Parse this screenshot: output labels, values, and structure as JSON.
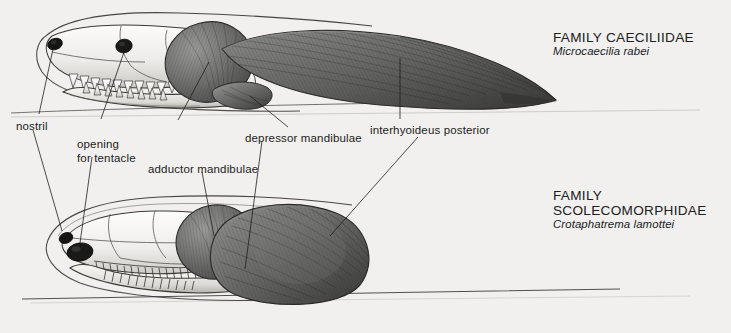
{
  "plate": {
    "background_color": "#f1f0ee",
    "ink_color": "#1c1c1c",
    "bone_color": "#f2f1ee",
    "muscle_color": "#6e6e6e",
    "muscle_dark": "#3b3b3b",
    "title": "Comparative cranial and jaw musculature of caecilians"
  },
  "specimens": [
    {
      "id": "upper",
      "family": "FAMILY CAECILIIDAE",
      "species": "Microcaecilia rabei",
      "family_label_x": 553,
      "family_label_y": 30,
      "description": "Elongate caeciliid skull with long slender interhyoideus posterior tapering posteriorly"
    },
    {
      "id": "lower",
      "family": "FAMILY SCOLECOMORPHIDAE",
      "species": "Crotaphatrema lamottei",
      "family_label_x": 553,
      "family_label_y": 188,
      "description": "Scolecomorphid skull with enlarged tentacle aperture and bulky blunt interhyoideus posterior"
    }
  ],
  "annotations": [
    {
      "key": "nostril",
      "text": "nostril",
      "x": 16,
      "y": 120,
      "align": "left",
      "lines": 1
    },
    {
      "key": "opening-for-tentacle",
      "text": "opening\nfor tentacle",
      "x": 77,
      "y": 140,
      "align": "left",
      "lines": 2
    },
    {
      "key": "adductor-mandibulae",
      "text": "adductor mandibulae",
      "x": 148,
      "y": 164,
      "align": "left",
      "lines": 1
    },
    {
      "key": "depressor-mandibulae",
      "text": "depressor mandibulae",
      "x": 245,
      "y": 133,
      "align": "left",
      "lines": 1
    },
    {
      "key": "interhyoideus-posterior",
      "text": "interhyoideus posterior",
      "x": 370,
      "y": 125,
      "align": "left",
      "lines": 1
    }
  ]
}
